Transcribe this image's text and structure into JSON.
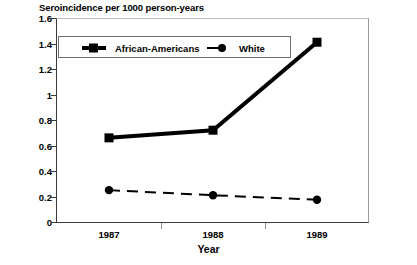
{
  "chart_data": {
    "type": "line",
    "title": "Seroincidence per 1000 person-years",
    "xlabel": "Year",
    "ylabel": "",
    "categories": [
      "1987",
      "1988",
      "1989"
    ],
    "ylim": [
      0,
      1.6
    ],
    "yticks": [
      "0",
      "0.2",
      "0.4",
      "0.6",
      "0.8",
      "1",
      "1.2",
      "1.4",
      "1.6"
    ],
    "ytick_values": [
      0,
      0.2,
      0.4,
      0.6,
      0.8,
      1,
      1.2,
      1.4,
      1.6
    ],
    "grid": false,
    "legend_position": "top-left inside plot",
    "series": [
      {
        "name": "African-Americans",
        "values": [
          0.66,
          0.72,
          1.41
        ],
        "marker": "square",
        "line_style": "solid",
        "line_width": 4,
        "color": "#000000"
      },
      {
        "name": "White",
        "values": [
          0.25,
          0.21,
          0.175
        ],
        "marker": "circle",
        "line_style": "dashed",
        "line_width": 2,
        "color": "#000000"
      }
    ]
  },
  "colors": {
    "series_primary": "#000000",
    "series_secondary": "#000000",
    "axis": "#3a3a3a",
    "frame_light": "#b8b8b8",
    "background": "#ffffff"
  }
}
